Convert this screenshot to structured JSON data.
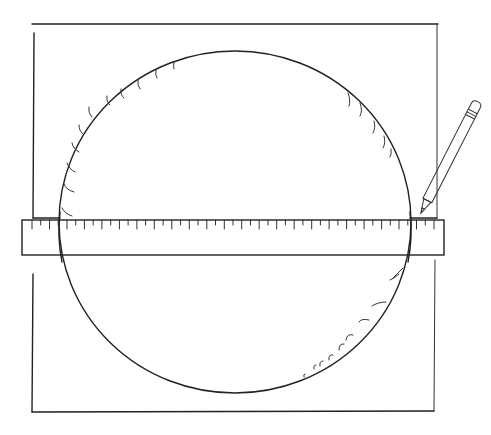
{
  "figure": {
    "colors": {
      "ink": "#222222",
      "paper": "#ffffff"
    },
    "circle": {
      "cx": 235,
      "cy": 220,
      "rx": 175,
      "ry": 170
    },
    "ruler": {
      "x": 22,
      "y": 220,
      "width": 422,
      "height": 35,
      "tick_count": 46
    },
    "top_frame": {
      "left": 34,
      "right": 437,
      "top": 24,
      "bottom": 218
    },
    "bottom_frame": {
      "left": 32,
      "right": 435,
      "top": 260,
      "bottom": 412
    },
    "pencil": {
      "tip": [
        420,
        212
      ],
      "eraser": [
        477,
        100
      ]
    }
  }
}
